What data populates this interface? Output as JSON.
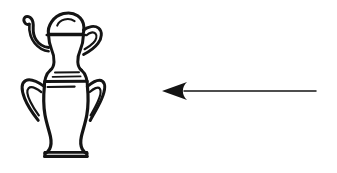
{
  "document": {
    "title": "Line drawing: lidded amphora vase with leftward arrow",
    "background_color": "#ffffff",
    "ink_color": "#141414",
    "width": 337,
    "height": 173
  },
  "figure": {
    "kind": "black-and-white line art",
    "objects": [
      {
        "id": "vase",
        "name": "lidded-amphora-vase",
        "label": "Lidded amphora vase",
        "bbox": [
          22,
          12,
          102,
          158
        ],
        "parts": [
          {
            "name": "dome-lid",
            "label": "Dome lid",
            "bbox": [
              47,
              12,
              84,
              35
            ]
          },
          {
            "name": "lid-inner-arc",
            "label": "Lid inner arc",
            "bbox": [
              56,
              17,
              76,
              26
            ]
          },
          {
            "name": "spout",
            "label": "Curved spout",
            "bbox": [
              23,
              15,
              44,
              48
            ]
          },
          {
            "name": "ear-handle-right",
            "label": "Small right ear handle",
            "bbox": [
              80,
              24,
              102,
              56
            ]
          },
          {
            "name": "neck",
            "label": "Neck",
            "bbox": [
              47,
              34,
              84,
              62
            ]
          },
          {
            "name": "shoulder-bands",
            "label": "Shoulder band lines",
            "bbox": [
              44,
              68,
              86,
              88
            ]
          },
          {
            "name": "loop-handle-left",
            "label": "Left loop handle",
            "bbox": [
              22,
              78,
              48,
              122
            ]
          },
          {
            "name": "loop-handle-right",
            "label": "Right loop handle",
            "bbox": [
              82,
              78,
              104,
              122
            ]
          },
          {
            "name": "body",
            "label": "Vase body",
            "bbox": [
              38,
              62,
              92,
              140
            ]
          },
          {
            "name": "pedestal-foot",
            "label": "Flared pedestal foot",
            "bbox": [
              44,
              130,
              89,
              158
            ]
          }
        ]
      },
      {
        "id": "arrow",
        "name": "left-pointing-arrow",
        "label": "Left-pointing arrow",
        "direction": "left",
        "tip": [
          162,
          91
        ],
        "tail": [
          316,
          91
        ],
        "head_length": 25,
        "head_half_width": 9,
        "shaft_thickness": 1.4
      }
    ]
  },
  "labels": {
    "vase_caption": "",
    "arrow_caption": ""
  }
}
